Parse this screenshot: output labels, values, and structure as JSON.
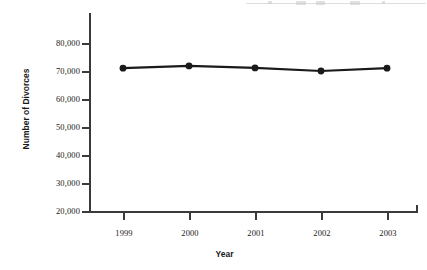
{
  "chart_data": {
    "type": "line",
    "title": "",
    "xlabel": "Year",
    "ylabel": "Number of Divorces",
    "categories": [
      "1999",
      "2000",
      "2001",
      "2002",
      "2003"
    ],
    "x": [
      1999,
      2000,
      2001,
      2002,
      2003
    ],
    "values": [
      71000,
      71800,
      71100,
      70000,
      71000
    ],
    "series": [
      {
        "name": "Number of Divorces",
        "values": [
          71000,
          71800,
          71100,
          70000,
          71000
        ]
      }
    ],
    "ylim": [
      20000,
      80000
    ],
    "ytick_values": [
      20000,
      30000,
      40000,
      50000,
      60000,
      70000,
      80000
    ],
    "ytick_labels": [
      "20,000",
      "30,000",
      "40,000",
      "50,000",
      "60,000",
      "70,000",
      "80,000"
    ],
    "xtick_labels": [
      "1999",
      "2000",
      "2001",
      "2002",
      "2003"
    ],
    "grid": false,
    "legend": false,
    "legend_position": "none",
    "marker": "filled-circle",
    "line_color": "#1a1a1a",
    "marker_color": "#1a1a1a",
    "axis_color": "#3a3a3a",
    "background_color": "#ffffff"
  }
}
